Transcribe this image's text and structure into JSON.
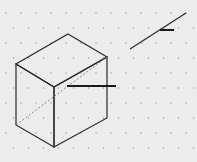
{
  "diagram": {
    "type": "isometric-drawing",
    "background": "#ececec",
    "dot_color": "#9a9a9a",
    "line_color": "#2a2a2a",
    "dot_grid": {
      "dx": 15,
      "dy": 15,
      "x0": 6,
      "y0": 13,
      "row_offset": 7.5
    },
    "cube": {
      "vertices": {
        "top": [
          68,
          34
        ],
        "left_top": [
          16,
          64
        ],
        "right_top": [
          107,
          57
        ],
        "front_top": [
          54,
          87
        ],
        "left_bottom": [
          16,
          125
        ],
        "front_bottom": [
          54,
          147
        ],
        "right_bottom": [
          107,
          118
        ]
      },
      "hidden_diagonal": {
        "from": [
          16,
          125
        ],
        "to": [
          107,
          57
        ]
      }
    },
    "pointer_line": {
      "from": [
        67,
        86
      ],
      "to": [
        116,
        86
      ]
    },
    "slanted_line": {
      "from": [
        130,
        49
      ],
      "to": [
        186,
        13
      ]
    },
    "slanted_tick": {
      "from": [
        160,
        30
      ],
      "to": [
        174,
        30
      ]
    }
  }
}
